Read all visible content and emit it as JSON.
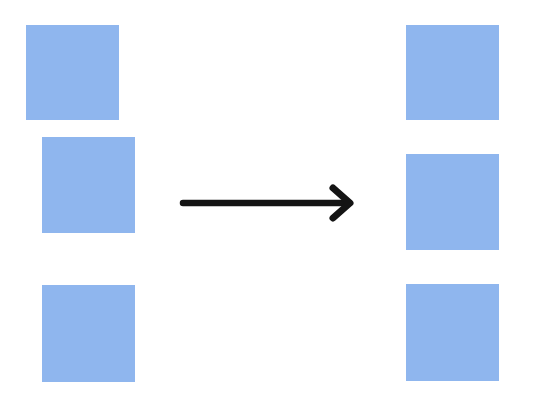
{
  "diagram": {
    "colors": {
      "square_fill": "#8fb6ee",
      "arrow": "#141414",
      "background": "#ffffff"
    },
    "before": {
      "label": "",
      "items": [
        {
          "name": "square-1"
        },
        {
          "name": "square-2"
        },
        {
          "name": "square-3"
        }
      ]
    },
    "after": {
      "label": "",
      "items": [
        {
          "name": "square-1"
        },
        {
          "name": "square-2"
        },
        {
          "name": "square-3"
        }
      ]
    },
    "arrow": {
      "direction": "right",
      "icon": "arrow-right-icon"
    }
  }
}
